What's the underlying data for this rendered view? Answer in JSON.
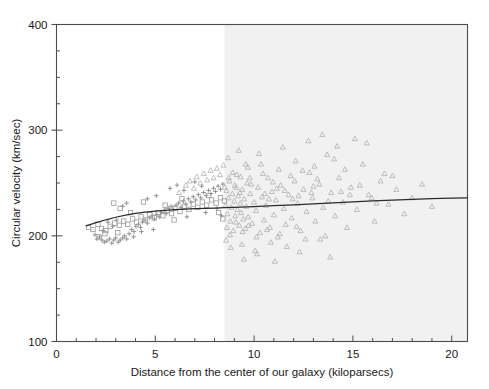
{
  "chart_data": {
    "type": "scatter",
    "title": "",
    "xlabel": "Distance from the center of our galaxy (kiloparsecs)",
    "ylabel": "Circular velocity (km/sec)",
    "xlim": [
      0,
      20.8
    ],
    "ylim": [
      100,
      400
    ],
    "xticks": [
      0,
      5,
      10,
      15,
      20
    ],
    "xtick_labels": [
      "0",
      "5",
      "10",
      "15",
      "20"
    ],
    "yticks": [
      100,
      200,
      300,
      400
    ],
    "ytick_labels": [
      "100",
      "200",
      "300",
      "400"
    ],
    "x_minor_tick_step": 1,
    "y_minor_tick_step": 25,
    "grid": false,
    "legend": null,
    "legend_position": "none",
    "frame": true,
    "colors": {
      "marker": "#8d8d8d",
      "marker_outer": "#b9b9b9",
      "trend_line": "#2b2b2b",
      "axis": "#4d4d4d",
      "text": "#1a1a1a",
      "shaded_region": "#f1f1f1",
      "background": "#ffffff"
    },
    "annotations": [
      {
        "name": "shaded-region",
        "type": "vertical-band",
        "x_start": 8.5,
        "x_end": 20.8,
        "fill": "#f1f1f1",
        "description": "Shaded band marking distances beyond the visible galactic disk"
      }
    ],
    "series": [
      {
        "name": "inner-disk-crosses",
        "marker": "cross",
        "color": "#8d8d8d",
        "points": [
          [
            1.95,
            201
          ],
          [
            2.05,
            197
          ],
          [
            2.18,
            199
          ],
          [
            2.3,
            196
          ],
          [
            2.42,
            194
          ],
          [
            2.55,
            195
          ],
          [
            2.68,
            197
          ],
          [
            2.8,
            193
          ],
          [
            2.9,
            196
          ],
          [
            3.0,
            198
          ],
          [
            3.12,
            194
          ],
          [
            3.22,
            196
          ],
          [
            3.35,
            198
          ],
          [
            3.45,
            200
          ],
          [
            3.55,
            197
          ],
          [
            3.68,
            202
          ],
          [
            3.8,
            206
          ],
          [
            3.92,
            204
          ],
          [
            4.02,
            209
          ],
          [
            4.15,
            211
          ],
          [
            4.25,
            208
          ],
          [
            4.35,
            213
          ],
          [
            4.48,
            215
          ],
          [
            4.6,
            212
          ],
          [
            4.72,
            217
          ],
          [
            4.85,
            219
          ],
          [
            4.95,
            216
          ],
          [
            5.08,
            220
          ],
          [
            5.2,
            218
          ],
          [
            5.32,
            222
          ],
          [
            5.45,
            224
          ],
          [
            5.55,
            221
          ],
          [
            5.68,
            226
          ],
          [
            5.8,
            228
          ],
          [
            5.92,
            225
          ],
          [
            6.05,
            229
          ],
          [
            6.18,
            231
          ],
          [
            6.3,
            227
          ],
          [
            6.42,
            233
          ],
          [
            6.55,
            230
          ],
          [
            6.68,
            235
          ],
          [
            6.8,
            232
          ],
          [
            6.92,
            237
          ],
          [
            7.05,
            234
          ],
          [
            7.18,
            239
          ],
          [
            7.3,
            236
          ],
          [
            7.45,
            241
          ],
          [
            7.58,
            238
          ],
          [
            7.7,
            243
          ],
          [
            7.82,
            240
          ],
          [
            7.95,
            245
          ],
          [
            8.05,
            242
          ],
          [
            8.18,
            247
          ],
          [
            8.3,
            244
          ],
          [
            8.42,
            249
          ],
          [
            3.35,
            228
          ],
          [
            3.55,
            231
          ],
          [
            4.6,
            235
          ],
          [
            5.05,
            238
          ],
          [
            5.75,
            245
          ],
          [
            6.1,
            248
          ],
          [
            6.45,
            243
          ],
          [
            7.0,
            251
          ],
          [
            7.35,
            247
          ],
          [
            2.6,
            213
          ],
          [
            2.85,
            209
          ],
          [
            3.05,
            215
          ],
          [
            4.3,
            204
          ],
          [
            4.9,
            206
          ],
          [
            6.6,
            218
          ],
          [
            7.55,
            222
          ],
          [
            8.12,
            226
          ],
          [
            8.35,
            219
          ],
          [
            2.35,
            205
          ],
          [
            3.9,
            199
          ]
        ]
      },
      {
        "name": "inner-disk-squares",
        "marker": "square",
        "color": "#9a9a9a",
        "points": [
          [
            1.62,
            208
          ],
          [
            1.85,
            206
          ],
          [
            2.1,
            211
          ],
          [
            2.28,
            207
          ],
          [
            2.5,
            205
          ],
          [
            2.72,
            209
          ],
          [
            2.95,
            212
          ],
          [
            3.18,
            210
          ],
          [
            3.4,
            214
          ],
          [
            3.6,
            211
          ],
          [
            3.85,
            216
          ],
          [
            4.05,
            213
          ],
          [
            4.28,
            218
          ],
          [
            4.5,
            215
          ],
          [
            4.72,
            220
          ],
          [
            4.95,
            217
          ],
          [
            5.15,
            222
          ],
          [
            5.38,
            219
          ],
          [
            5.6,
            224
          ],
          [
            5.82,
            221
          ],
          [
            6.0,
            226
          ],
          [
            6.25,
            223
          ],
          [
            6.48,
            228
          ],
          [
            6.7,
            225
          ],
          [
            6.92,
            230
          ],
          [
            7.15,
            227
          ],
          [
            7.38,
            232
          ],
          [
            7.6,
            229
          ],
          [
            7.85,
            234
          ],
          [
            8.08,
            231
          ],
          [
            8.3,
            236
          ],
          [
            8.5,
            233
          ],
          [
            2.9,
            231
          ],
          [
            3.22,
            226
          ],
          [
            3.75,
            222
          ],
          [
            4.4,
            232
          ],
          [
            5.5,
            229
          ],
          [
            6.35,
            235
          ],
          [
            7.7,
            238
          ],
          [
            2.15,
            199
          ],
          [
            2.45,
            202
          ],
          [
            5.95,
            215
          ],
          [
            8.2,
            222
          ],
          [
            8.42,
            216
          ],
          [
            3.1,
            203
          ]
        ]
      },
      {
        "name": "outer-disk-triangles",
        "marker": "triangle",
        "color": "#b0b0b0",
        "points": [
          [
            6.2,
            241
          ],
          [
            6.55,
            248
          ],
          [
            6.75,
            252
          ],
          [
            6.95,
            245
          ],
          [
            7.1,
            256
          ],
          [
            7.28,
            250
          ],
          [
            7.45,
            259
          ],
          [
            7.62,
            253
          ],
          [
            7.8,
            262
          ],
          [
            7.95,
            255
          ],
          [
            8.12,
            264
          ],
          [
            8.28,
            258
          ],
          [
            8.45,
            267
          ],
          [
            8.55,
            229
          ],
          [
            8.6,
            243
          ],
          [
            8.65,
            221
          ],
          [
            8.7,
            236
          ],
          [
            8.75,
            252
          ],
          [
            8.8,
            214
          ],
          [
            8.85,
            227
          ],
          [
            8.9,
            240
          ],
          [
            8.95,
            205
          ],
          [
            9.0,
            233
          ],
          [
            9.05,
            219
          ],
          [
            9.1,
            246
          ],
          [
            9.15,
            225
          ],
          [
            9.2,
            238
          ],
          [
            9.25,
            210
          ],
          [
            9.3,
            231
          ],
          [
            9.35,
            222
          ],
          [
            9.4,
            244
          ],
          [
            9.45,
            216
          ],
          [
            9.5,
            235
          ],
          [
            9.55,
            207
          ],
          [
            9.6,
            228
          ],
          [
            9.65,
            250
          ],
          [
            9.7,
            218
          ],
          [
            9.8,
            240
          ],
          [
            9.9,
            212
          ],
          [
            10.0,
            232
          ],
          [
            10.1,
            224
          ],
          [
            10.2,
            246
          ],
          [
            10.3,
            203
          ],
          [
            10.4,
            237
          ],
          [
            10.5,
            215
          ],
          [
            10.6,
            229
          ],
          [
            10.7,
            255
          ],
          [
            10.8,
            208
          ],
          [
            10.9,
            242
          ],
          [
            11.0,
            220
          ],
          [
            11.1,
            234
          ],
          [
            11.2,
            199
          ],
          [
            11.35,
            248
          ],
          [
            11.5,
            226
          ],
          [
            11.6,
            211
          ],
          [
            11.75,
            239
          ],
          [
            11.9,
            217
          ],
          [
            12.05,
            252
          ],
          [
            12.2,
            231
          ],
          [
            12.35,
            205
          ],
          [
            12.5,
            244
          ],
          [
            12.65,
            223
          ],
          [
            12.8,
            260
          ],
          [
            12.95,
            236
          ],
          [
            13.1,
            214
          ],
          [
            13.3,
            249
          ],
          [
            13.5,
            227
          ],
          [
            13.7,
            277
          ],
          [
            13.9,
            241
          ],
          [
            14.1,
            219
          ],
          [
            14.3,
            255
          ],
          [
            14.5,
            232
          ],
          [
            14.7,
            208
          ],
          [
            14.9,
            246
          ],
          [
            15.2,
            225
          ],
          [
            15.5,
            268
          ],
          [
            15.8,
            239
          ],
          [
            16.1,
            214
          ],
          [
            16.4,
            252
          ],
          [
            16.8,
            230
          ],
          [
            17.2,
            244
          ],
          [
            17.6,
            221
          ],
          [
            18.0,
            236
          ],
          [
            18.5,
            249
          ],
          [
            19.0,
            228
          ],
          [
            8.58,
            196
          ],
          [
            8.82,
            189
          ],
          [
            9.12,
            258
          ],
          [
            9.38,
            192
          ],
          [
            9.68,
            265
          ],
          [
            10.05,
            186
          ],
          [
            10.45,
            259
          ],
          [
            10.85,
            194
          ],
          [
            11.25,
            263
          ],
          [
            11.65,
            190
          ],
          [
            12.1,
            271
          ],
          [
            12.6,
            197
          ],
          [
            13.05,
            266
          ],
          [
            13.6,
            200
          ],
          [
            14.05,
            273
          ],
          [
            9.48,
            178
          ],
          [
            10.15,
            183
          ],
          [
            11.05,
            176
          ],
          [
            12.3,
            185
          ],
          [
            13.85,
            180
          ],
          [
            8.68,
            274
          ],
          [
            9.22,
            281
          ],
          [
            10.25,
            278
          ],
          [
            11.45,
            284
          ],
          [
            12.75,
            290
          ],
          [
            14.2,
            285
          ],
          [
            15.1,
            292
          ],
          [
            13.45,
            296
          ],
          [
            15.7,
            288
          ],
          [
            16.6,
            259
          ],
          [
            9.58,
            268
          ],
          [
            8.92,
            260
          ],
          [
            9.78,
            255
          ],
          [
            10.35,
            268
          ],
          [
            10.95,
            251
          ],
          [
            11.85,
            257
          ],
          [
            12.45,
            262
          ],
          [
            13.2,
            254
          ],
          [
            14.6,
            263
          ],
          [
            15.35,
            248
          ],
          [
            9.02,
            248
          ],
          [
            9.32,
            256
          ],
          [
            10.55,
            240
          ],
          [
            11.15,
            245
          ],
          [
            11.95,
            235
          ],
          [
            12.9,
            241
          ],
          [
            13.75,
            233
          ],
          [
            14.85,
            239
          ],
          [
            16.2,
            231
          ],
          [
            17.0,
            257
          ],
          [
            8.62,
            208
          ],
          [
            8.78,
            201
          ],
          [
            9.08,
            213
          ],
          [
            9.42,
            204
          ],
          [
            9.72,
            210
          ],
          [
            10.12,
            199
          ],
          [
            10.65,
            206
          ],
          [
            11.3,
            202
          ],
          [
            12.15,
            209
          ],
          [
            13.35,
            197
          ],
          [
            8.52,
            246
          ],
          [
            8.72,
            255
          ],
          [
            9.28,
            241
          ],
          [
            9.85,
            249
          ],
          [
            10.75,
            235
          ],
          [
            11.55,
            243
          ],
          [
            12.25,
            238
          ],
          [
            13.0,
            247
          ],
          [
            14.4,
            242
          ],
          [
            15.95,
            236
          ]
        ]
      }
    ],
    "trend_curve": {
      "name": "fitted-rotation-curve",
      "color": "#2b2b2b",
      "points": [
        [
          1.5,
          209.5
        ],
        [
          2.0,
          212.5
        ],
        [
          2.5,
          215.2
        ],
        [
          3.0,
          217.6
        ],
        [
          3.5,
          219.6
        ],
        [
          4.0,
          221.2
        ],
        [
          4.5,
          222.4
        ],
        [
          5.0,
          223.4
        ],
        [
          5.5,
          224.2
        ],
        [
          6.0,
          224.8
        ],
        [
          6.5,
          225.3
        ],
        [
          7.0,
          225.7
        ],
        [
          7.5,
          226.0
        ],
        [
          8.0,
          226.3
        ],
        [
          8.5,
          226.6
        ],
        [
          9.0,
          226.9
        ],
        [
          10.0,
          227.6
        ],
        [
          11.0,
          228.5
        ],
        [
          12.0,
          229.4
        ],
        [
          13.0,
          230.3
        ],
        [
          14.0,
          231.2
        ],
        [
          15.0,
          232.1
        ],
        [
          16.0,
          233.0
        ],
        [
          17.0,
          233.8
        ],
        [
          18.0,
          234.5
        ],
        [
          19.0,
          235.1
        ],
        [
          20.0,
          235.6
        ],
        [
          20.8,
          236.0
        ]
      ]
    }
  }
}
